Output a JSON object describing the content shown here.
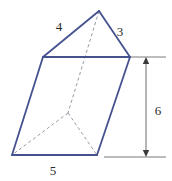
{
  "figure": {
    "name": "triangular-prism-diagram",
    "shape": "triangular prism",
    "colors": {
      "visible_edge": "#45528f",
      "hidden_edge": "#9a9aa8",
      "dimension_line": "#6b6b6b",
      "label_text": "#2b2b2b",
      "background": "#ffffff"
    },
    "labels": [
      {
        "id": "edge-4",
        "text": "4",
        "x": 59,
        "y": 26
      },
      {
        "id": "edge-3",
        "text": "3",
        "x": 120,
        "y": 31
      },
      {
        "id": "edge-5",
        "text": "5",
        "x": 53,
        "y": 170
      },
      {
        "id": "height-6",
        "text": "6",
        "x": 158,
        "y": 110
      }
    ],
    "measurements": {
      "top_left_slant": "4",
      "top_right_slant": "3",
      "bottom_front_edge": "5",
      "prism_height": "6"
    },
    "vertices": {
      "apex_front": [
        99,
        11
      ],
      "top_left": [
        43,
        57
      ],
      "top_right": [
        130,
        57
      ],
      "bottom_left": [
        12,
        155
      ],
      "bottom_right": [
        97,
        155
      ],
      "back_bottom": [
        68,
        113
      ]
    },
    "geometry": {
      "visible_path_front_triangle": "M 43 57 L 99 11 L 130 57 Z",
      "visible_left_face": "M 43 57 L 12 155",
      "visible_front_face": "M 12 155 L 97 155",
      "visible_right_face": "M 130 57 L 97 155",
      "hidden_apex_to_back": "M 99 11 L 68 113",
      "hidden_back_to_bottom_left": "M 68 113 L 12 155",
      "hidden_back_to_bottom_right": "M 68 113 L 97 155",
      "dimension_line_x": 146,
      "dimension_top_y": 57,
      "dimension_bottom_y": 157,
      "extension_top": "M 131 57 L 166 57",
      "extension_bottom": "M 104 157 L 166 157"
    }
  }
}
